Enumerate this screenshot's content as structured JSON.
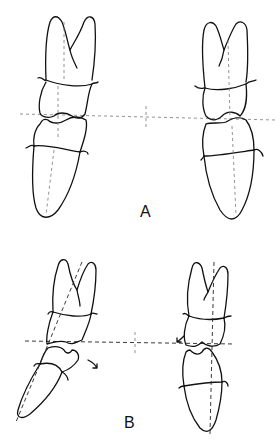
{
  "figure": {
    "panels": [
      {
        "id": "A",
        "label": "A",
        "description": "Aligned upper and lower teeth with horizontal occlusal reference line"
      },
      {
        "id": "B",
        "label": "B",
        "description": "Tilted teeth with dashed long axes, occlusal line and rotation arrows"
      }
    ],
    "colors": {
      "line": "#111111",
      "guide": "#777777",
      "background": "#ffffff"
    }
  }
}
